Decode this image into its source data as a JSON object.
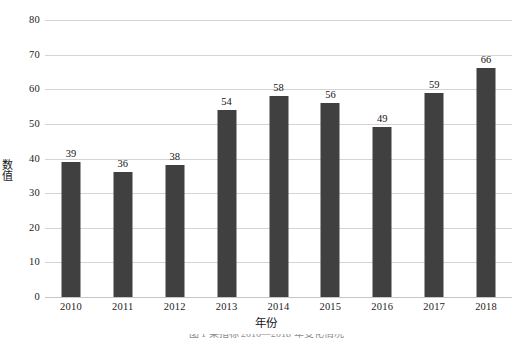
{
  "chart_data": {
    "type": "bar",
    "title": "",
    "xlabel": "年份",
    "ylabel": "数值",
    "categories": [
      "2010",
      "2011",
      "2012",
      "2013",
      "2014",
      "2015",
      "2016",
      "2017",
      "2018"
    ],
    "values": [
      39,
      36,
      38,
      54,
      58,
      56,
      49,
      59,
      66
    ],
    "value_labels": [
      "39",
      "36",
      "38",
      "54",
      "58",
      "56",
      "49",
      "59",
      "66"
    ],
    "ylim": [
      0,
      80
    ],
    "ytick_values": [
      0,
      10,
      20,
      30,
      40,
      50,
      60,
      70,
      80
    ],
    "ytick_labels": [
      "0",
      "10",
      "20",
      "30",
      "40",
      "50",
      "60",
      "70",
      "80"
    ],
    "grid": true,
    "grid_axis": "y",
    "legend": false,
    "bar_color": "#404040",
    "grid_color": "#d4d4d4",
    "background_color": "#ffffff",
    "data_labels_shown": true
  },
  "figure": {
    "caption_partial": "图 1  某指标 2010—2018 年变化情况"
  }
}
